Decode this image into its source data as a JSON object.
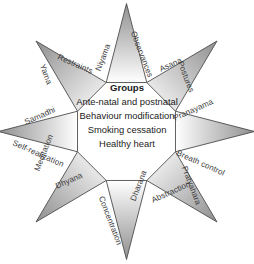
{
  "diagram": {
    "shape": "eight-pointed-star",
    "background_color": "#ffffff",
    "outline_color": "#4d4d4d",
    "fill_gradient_from": "#9a9a9a",
    "fill_gradient_to": "#ffffff",
    "center": {
      "heading": "Groups",
      "lines": [
        "Ante-natal and postnatal",
        "Behaviour modification",
        "Smoking cessation",
        "Healthy heart"
      ]
    },
    "points": [
      {
        "index": 0,
        "direction": "top",
        "sanskrit": "Niyama",
        "english": "Observances",
        "sanskrit_rotation": -69,
        "english_rotation": 69,
        "sanskrit_x": 98,
        "sanskrit_y": 66,
        "english_x": 133,
        "english_y": 27
      },
      {
        "index": 1,
        "direction": "upper-right",
        "sanskrit": "Postures",
        "english": "Asana",
        "sanskrit_rotation": 69,
        "english_rotation": -24,
        "sanskrit_x": 180,
        "sanskrit_y": 57,
        "english_x": 160,
        "english_y": 65
      },
      {
        "index": 2,
        "direction": "right",
        "sanskrit": "Pranayama",
        "english": "Breath control",
        "sanskrit_rotation": -24,
        "english_rotation": 24,
        "sanskrit_x": 174,
        "sanskrit_y": 114,
        "english_x": 177,
        "english_y": 148
      },
      {
        "index": 3,
        "direction": "lower-right",
        "sanskrit": "Pratyahara",
        "english": "Abstraction",
        "sanskrit_rotation": 69,
        "english_rotation": -24,
        "sanskrit_x": 184,
        "sanskrit_y": 162,
        "english_x": 152,
        "english_y": 196
      },
      {
        "index": 4,
        "direction": "bottom",
        "sanskrit": "Dharana",
        "english": "Concentration",
        "sanskrit_rotation": -69,
        "english_rotation": 69,
        "sanskrit_x": 133,
        "sanskrit_y": 196,
        "english_x": 101,
        "english_y": 192
      },
      {
        "index": 5,
        "direction": "lower-left",
        "sanskrit": "Dhyana",
        "english": "Meditation",
        "sanskrit_rotation": -24,
        "english_rotation": -69,
        "sanskrit_x": 56,
        "sanskrit_y": 182,
        "english_x": 37,
        "english_y": 166
      },
      {
        "index": 6,
        "direction": "left",
        "sanskrit": "Samadhi",
        "english": "Self-realization",
        "sanskrit_rotation": -24,
        "english_rotation": 24,
        "sanskrit_x": 25,
        "sanskrit_y": 118,
        "english_x": 13,
        "english_y": 138
      },
      {
        "index": 7,
        "direction": "upper-left",
        "sanskrit": "Yama",
        "english": "Restraints",
        "sanskrit_rotation": 69,
        "english_rotation": 24,
        "sanskrit_x": 42,
        "sanskrit_y": 60,
        "english_x": 58,
        "english_y": 52
      }
    ]
  }
}
